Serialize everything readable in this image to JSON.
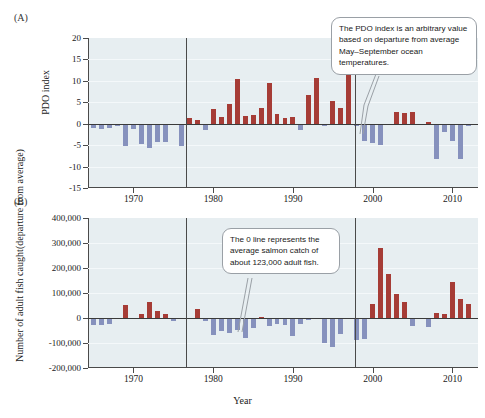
{
  "figure": {
    "panel_a_label": "(A)",
    "panel_b_label": "(B)"
  },
  "callouts": {
    "a": "The PDO index is an arbitrary value based on departure from average May–September ocean temperatures.",
    "b": "The 0 line represents the average salmon catch of about 123,000 adult fish."
  },
  "colors": {
    "positive_bar": "#a63c36",
    "negative_bar": "#8691bd",
    "plot_background": "#e7eef1",
    "axis": "#4a4a4a"
  },
  "chart_data": [
    {
      "type": "bar",
      "panel": "(A)",
      "title": "",
      "xlabel": "",
      "ylabel": "PDO index",
      "ylim": [
        -15,
        20
      ],
      "yticks": [
        20,
        15,
        10,
        5,
        0,
        -5,
        -10,
        -15
      ],
      "ytick_labels": [
        "20",
        "15",
        "10",
        "5",
        "0",
        "-5",
        "-10",
        "-15"
      ],
      "xlim": [
        1964.3,
        2013.2
      ],
      "xticks": [
        1970,
        1980,
        1990,
        2000,
        2010
      ],
      "xtick_labels": [
        "1970",
        "1980",
        "1990",
        "2000",
        "2010"
      ],
      "grid": true,
      "legend": "none",
      "annotations": [
        {
          "type": "vline",
          "x": 1976.6,
          "note": "regime shift"
        },
        {
          "type": "vline",
          "x": 1997.8,
          "note": "regime shift"
        }
      ],
      "x": [
        1965,
        1966,
        1967,
        1968,
        1969,
        1970,
        1971,
        1972,
        1973,
        1974,
        1975,
        1976,
        1977,
        1978,
        1979,
        1980,
        1981,
        1982,
        1983,
        1984,
        1985,
        1986,
        1987,
        1988,
        1989,
        1990,
        1991,
        1992,
        1993,
        1994,
        1995,
        1996,
        1997,
        1998,
        1999,
        2000,
        2001,
        2002,
        2003,
        2004,
        2005,
        2006,
        2007,
        2008,
        2009,
        2010,
        2011,
        2012
      ],
      "values": [
        -0.9,
        -1.2,
        -1.0,
        -0.6,
        -5.2,
        -1.3,
        -4.8,
        -5.6,
        -4.2,
        -4.3,
        -0.4,
        -5.2,
        1.3,
        0.8,
        -1.5,
        3.4,
        1.6,
        4.5,
        10.4,
        1.7,
        2.1,
        3.6,
        9.5,
        2.2,
        1.4,
        1.5,
        -1.4,
        6.7,
        10.7,
        -0.5,
        5.4,
        3.7,
        11.4,
        -0.5,
        -4.1,
        -4.4,
        -4.9,
        -0.3,
        2.8,
        2.4,
        2.8,
        -0.3,
        0.4,
        -8.3,
        -2.0,
        -4.1,
        -8.3,
        -0.6
      ]
    },
    {
      "type": "bar",
      "panel": "(B)",
      "title": "",
      "xlabel": "Year",
      "ylabel": "Number of adult fish caught (departure from average)",
      "ylabel_line1": "Number of adult fish caught",
      "ylabel_line2": "(departure from average)",
      "ylim": [
        -200000,
        400000
      ],
      "yticks": [
        400000,
        300000,
        200000,
        100000,
        0,
        -100000,
        -200000
      ],
      "ytick_labels": [
        "400,000",
        "300,000",
        "200,000",
        "100,000",
        "0",
        "-100,000",
        "-200,000"
      ],
      "xlim": [
        1964.3,
        2013.2
      ],
      "xticks": [
        1970,
        1980,
        1990,
        2000,
        2010
      ],
      "xtick_labels": [
        "1970",
        "1980",
        "1990",
        "2000",
        "2010"
      ],
      "grid": true,
      "legend": "none",
      "annotations": [
        {
          "type": "vline",
          "x": 1976.6,
          "note": "regime shift"
        },
        {
          "type": "vline",
          "x": 1997.8,
          "note": "regime shift"
        }
      ],
      "x": [
        1965,
        1966,
        1967,
        1968,
        1969,
        1970,
        1971,
        1972,
        1973,
        1974,
        1975,
        1976,
        1977,
        1978,
        1979,
        1980,
        1981,
        1982,
        1983,
        1984,
        1985,
        1986,
        1987,
        1988,
        1989,
        1990,
        1991,
        1992,
        1993,
        1994,
        1995,
        1996,
        1997,
        1998,
        1999,
        2000,
        2001,
        2002,
        2003,
        2004,
        2005,
        2006,
        2007,
        2008,
        2009,
        2010,
        2011,
        2012
      ],
      "values": [
        -28000,
        -27000,
        -22000,
        -4000,
        53000,
        -3000,
        15000,
        66000,
        28000,
        17000,
        -12000,
        -2000,
        2000,
        37000,
        -13000,
        -68000,
        -52000,
        -58000,
        -49000,
        -78000,
        -41000,
        3000,
        -33000,
        -23000,
        -26000,
        -70000,
        -25000,
        -7000,
        -5000,
        -99000,
        -114000,
        -64000,
        -3000,
        -88000,
        -82000,
        55000,
        281000,
        175000,
        97000,
        64000,
        -31000,
        -4000,
        -35000,
        21000,
        17000,
        144000,
        76000,
        55000
      ]
    }
  ]
}
